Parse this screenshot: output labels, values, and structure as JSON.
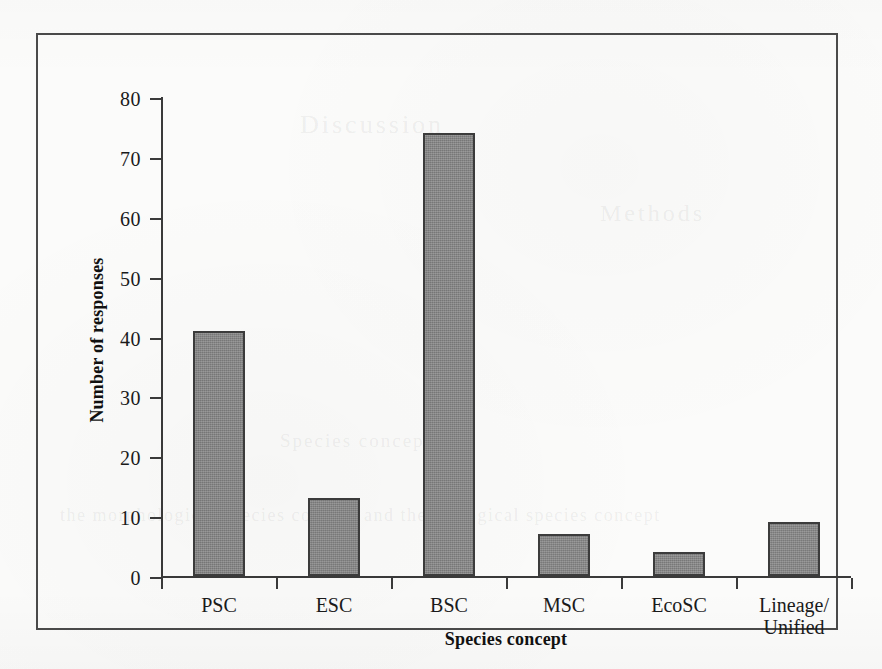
{
  "chart_data": {
    "type": "bar",
    "title": "",
    "xlabel": "Species concept",
    "ylabel": "Number of responses",
    "categories": [
      "PSC",
      "ESC",
      "BSC",
      "MSC",
      "EcoSC",
      "Lineage/\nUnified"
    ],
    "values": [
      41,
      13,
      74,
      7,
      4,
      9
    ],
    "ylim": [
      0,
      80
    ],
    "yticks": [
      0,
      10,
      20,
      30,
      40,
      50,
      60,
      70,
      80
    ],
    "ytick_labels": [
      "0",
      "10",
      "20",
      "30",
      "40",
      "50",
      "60",
      "70",
      "80"
    ],
    "grid": false,
    "legend": null,
    "bar_color": "#878787",
    "bar_edge_color": "#3c3c3c",
    "axis_color": "#3a3a3a",
    "frame_color": "#4a4a4a",
    "background_color": "#fbfbfa"
  },
  "ghost_text": {
    "line1": "Discussion",
    "line2": "Methods",
    "line3": "Species concepts",
    "line4": "the morphological species concept and the biological species concept"
  }
}
